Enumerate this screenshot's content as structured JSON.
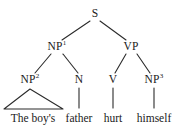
{
  "figure": {
    "type": "syntax-tree",
    "sentence": "The boy's father hurt himself",
    "background_color": "#ffffff",
    "line_color": "#2b2b2b",
    "text_color": "#1a1a1a"
  },
  "nodes": {
    "s": {
      "label": "S",
      "superscript": "",
      "x": 95,
      "y": 14
    },
    "np1": {
      "label": "NP",
      "superscript": "1",
      "x": 57,
      "y": 47
    },
    "vp": {
      "label": "VP",
      "superscript": "",
      "x": 131,
      "y": 47
    },
    "np2": {
      "label": "NP",
      "superscript": "2",
      "x": 30,
      "y": 80
    },
    "n": {
      "label": "N",
      "superscript": "",
      "x": 79,
      "y": 80
    },
    "v": {
      "label": "V",
      "superscript": "",
      "x": 113,
      "y": 80
    },
    "np3": {
      "label": "NP",
      "superscript": "3",
      "x": 154,
      "y": 80
    }
  },
  "terminals": {
    "t1": {
      "label": "The boy's",
      "x": 33,
      "y": 113
    },
    "t2": {
      "label": "father",
      "x": 79,
      "y": 113
    },
    "t3": {
      "label": "hurt",
      "x": 113,
      "y": 113
    },
    "t4": {
      "label": "himself",
      "x": 154,
      "y": 113
    }
  },
  "triangle": {
    "name": "np2-triangle",
    "apex_x": 30,
    "apex_y": 89,
    "base_left_x": 4,
    "base_right_x": 63,
    "base_y": 109
  }
}
